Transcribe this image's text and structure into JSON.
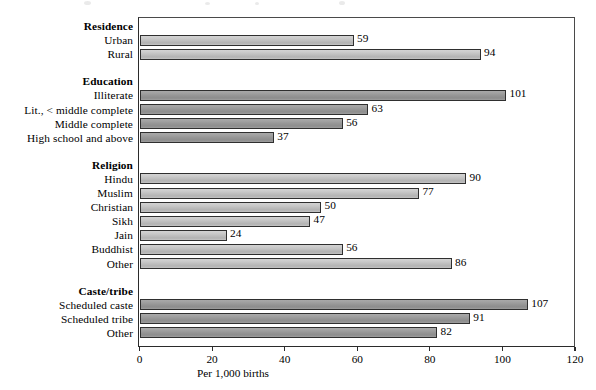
{
  "chart_data": {
    "type": "bar",
    "orientation": "horizontal",
    "title": "",
    "xlabel": "Per 1,000 births",
    "ylabel": "",
    "xlim": [
      0,
      120
    ],
    "xticks": [
      0,
      20,
      40,
      60,
      80,
      100,
      120
    ],
    "grid": false,
    "legend": null,
    "groups": [
      {
        "name": "Residence",
        "shade": "light",
        "items": [
          {
            "label": "Urban",
            "value": 59
          },
          {
            "label": "Rural",
            "value": 94
          }
        ]
      },
      {
        "name": "Education",
        "shade": "dark",
        "items": [
          {
            "label": "Illiterate",
            "value": 101
          },
          {
            "label": "Lit., < middle complete",
            "value": 63
          },
          {
            "label": "Middle complete",
            "value": 56
          },
          {
            "label": "High school and above",
            "value": 37
          }
        ]
      },
      {
        "name": "Religion",
        "shade": "light",
        "items": [
          {
            "label": "Hindu",
            "value": 90
          },
          {
            "label": "Muslim",
            "value": 77
          },
          {
            "label": "Christian",
            "value": 50
          },
          {
            "label": "Sikh",
            "value": 47
          },
          {
            "label": "Jain",
            "value": 24
          },
          {
            "label": "Buddhist",
            "value": 56
          },
          {
            "label": "Other",
            "value": 86
          }
        ]
      },
      {
        "name": "Caste/tribe",
        "shade": "dark",
        "items": [
          {
            "label": "Scheduled caste",
            "value": 107
          },
          {
            "label": "Scheduled tribe",
            "value": 91
          },
          {
            "label": "Other",
            "value": 82
          }
        ]
      }
    ],
    "categories": [
      "Urban",
      "Rural",
      "Illiterate",
      "Lit., < middle complete",
      "Middle complete",
      "High school and above",
      "Hindu",
      "Muslim",
      "Christian",
      "Sikh",
      "Jain",
      "Buddhist",
      "Other",
      "Scheduled caste",
      "Scheduled tribe",
      "Other"
    ],
    "values": [
      59,
      94,
      101,
      63,
      56,
      37,
      90,
      77,
      50,
      47,
      24,
      56,
      86,
      107,
      91,
      82
    ],
    "colors": {
      "bar_light": "#c6c6c6",
      "bar_dark": "#9a9a9a",
      "bar_outline": "#2f2f2f",
      "axis": "#2b2b2b",
      "text": "#000000",
      "background": "#ffffff"
    }
  }
}
